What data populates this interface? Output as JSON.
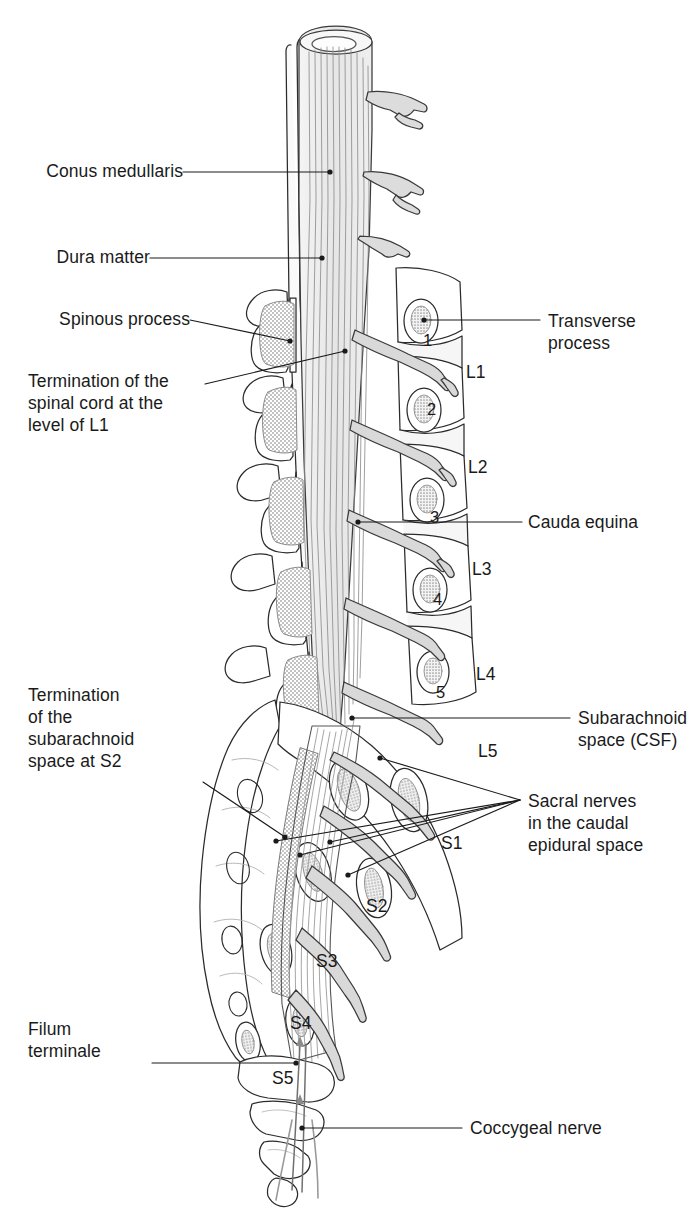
{
  "figure": {
    "style": {
      "background": "#ffffff",
      "ink": "#1a1a1a",
      "line": "#2b2b2b",
      "bone_fill": "#ffffff",
      "stipple_gray": "#b9b9b9",
      "nerve_gray": "#d2d2d2",
      "cord_fill": "#ececec"
    }
  },
  "labels_left": [
    {
      "id": "conus-medullaris",
      "text": "Conus medullaris",
      "lines": [
        "Conus medullaris"
      ]
    },
    {
      "id": "dura-matter",
      "text": "Dura matter",
      "lines": [
        "Dura matter"
      ]
    },
    {
      "id": "spinous-process",
      "text": "Spinous process",
      "lines": [
        "Spinous process"
      ]
    },
    {
      "id": "termination-spinal-cord",
      "text": "Termination of the spinal cord at the level of L1",
      "lines": [
        "Termination of the",
        "spinal cord at the",
        "level of L1"
      ]
    },
    {
      "id": "termination-subarachnoid",
      "text": "Termination of the subarachnoid space at S2",
      "lines": [
        "Termination",
        "of the",
        "subarachnoid",
        "space at S2"
      ]
    },
    {
      "id": "filum-terminale",
      "text": "Filum terminale",
      "lines": [
        "Filum",
        "terminale"
      ]
    }
  ],
  "labels_right": [
    {
      "id": "transverse-process",
      "text": "Transverse process",
      "lines": [
        "Transverse",
        "process"
      ]
    },
    {
      "id": "cauda-equina",
      "text": "Cauda equina",
      "lines": [
        "Cauda equina"
      ]
    },
    {
      "id": "subarachnoid-space",
      "text": "Subarachnoid space (CSF)",
      "lines": [
        "Subarachnoid",
        "space (CSF)"
      ]
    },
    {
      "id": "sacral-nerves",
      "text": "Sacral nerves in the caudal epidural space",
      "lines": [
        "Sacral nerves",
        "in the caudal",
        "epidural space"
      ]
    },
    {
      "id": "coccygeal-nerve",
      "text": "Coccygeal nerve",
      "lines": [
        "Coccygeal nerve"
      ]
    }
  ],
  "vertebra_levels": [
    {
      "id": "L1",
      "label": "L1"
    },
    {
      "id": "L2",
      "label": "L2"
    },
    {
      "id": "L3",
      "label": "L3"
    },
    {
      "id": "L4",
      "label": "L4"
    },
    {
      "id": "L5",
      "label": "L5"
    }
  ],
  "sacral_levels": [
    {
      "id": "S1",
      "label": "S1"
    },
    {
      "id": "S2",
      "label": "S2"
    },
    {
      "id": "S3",
      "label": "S3"
    },
    {
      "id": "S4",
      "label": "S4"
    },
    {
      "id": "S5",
      "label": "S5"
    }
  ],
  "nerve_root_numbers": [
    {
      "id": "root-1",
      "label": "1"
    },
    {
      "id": "root-2",
      "label": "2"
    },
    {
      "id": "root-3",
      "label": "3"
    },
    {
      "id": "root-4",
      "label": "4"
    },
    {
      "id": "root-5",
      "label": "5"
    }
  ]
}
